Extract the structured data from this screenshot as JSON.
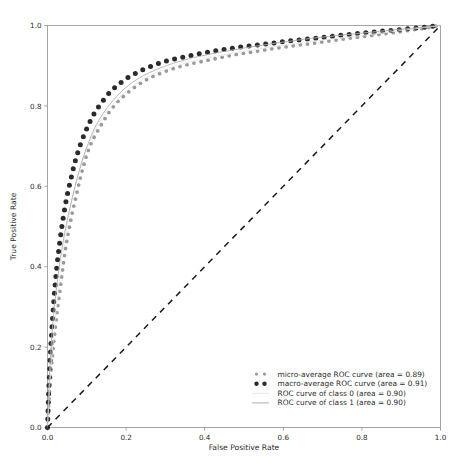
{
  "chart_data": {
    "type": "line",
    "title": "",
    "xlabel": "False Positive Rate",
    "ylabel": "True Positive Rate",
    "xlim": [
      0.0,
      1.0
    ],
    "ylim": [
      0.0,
      1.0
    ],
    "grid": false,
    "legend_position": "lower right",
    "xticks": [
      "0.0",
      "0.2",
      "0.4",
      "0.6",
      "0.8",
      "1.0"
    ],
    "xtick_values": [
      0.0,
      0.2,
      0.4,
      0.6,
      0.8,
      1.0
    ],
    "yticks": [
      "0.0",
      "0.2",
      "0.4",
      "0.6",
      "0.8",
      "1.0"
    ],
    "ytick_values": [
      0.0,
      0.2,
      0.4,
      0.6,
      0.8,
      1.0
    ],
    "series": [
      {
        "name": "micro-average ROC curve (area = 0.89)",
        "style": "dotted",
        "color": "#9a9a9a",
        "marker": "dot",
        "area": 0.89,
        "x": [
          0.0,
          0.004,
          0.008,
          0.012,
          0.016,
          0.02,
          0.024,
          0.028,
          0.032,
          0.036,
          0.04,
          0.045,
          0.05,
          0.056,
          0.062,
          0.068,
          0.075,
          0.082,
          0.09,
          0.1,
          0.11,
          0.12,
          0.135,
          0.15,
          0.165,
          0.18,
          0.2,
          0.22,
          0.245,
          0.27,
          0.3,
          0.33,
          0.36,
          0.4,
          0.44,
          0.48,
          0.52,
          0.57,
          0.62,
          0.67,
          0.72,
          0.78,
          0.84,
          0.9,
          0.95,
          1.0
        ],
        "y": [
          0.0,
          0.075,
          0.13,
          0.175,
          0.215,
          0.25,
          0.285,
          0.315,
          0.345,
          0.375,
          0.405,
          0.44,
          0.47,
          0.5,
          0.53,
          0.555,
          0.585,
          0.615,
          0.645,
          0.68,
          0.705,
          0.725,
          0.75,
          0.775,
          0.795,
          0.812,
          0.83,
          0.845,
          0.862,
          0.874,
          0.886,
          0.896,
          0.904,
          0.912,
          0.92,
          0.928,
          0.934,
          0.942,
          0.949,
          0.955,
          0.962,
          0.97,
          0.977,
          0.985,
          0.992,
          1.0
        ]
      },
      {
        "name": "macro-average ROC curve (area = 0.91)",
        "style": "dotted",
        "color": "#2b2b2b",
        "marker": "dot",
        "area": 0.91,
        "x": [
          0.0,
          0.003,
          0.006,
          0.009,
          0.012,
          0.015,
          0.018,
          0.022,
          0.026,
          0.03,
          0.034,
          0.038,
          0.043,
          0.048,
          0.054,
          0.06,
          0.067,
          0.075,
          0.084,
          0.094,
          0.105,
          0.117,
          0.13,
          0.145,
          0.162,
          0.18,
          0.2,
          0.222,
          0.246,
          0.272,
          0.3,
          0.33,
          0.362,
          0.4,
          0.44,
          0.48,
          0.52,
          0.57,
          0.62,
          0.67,
          0.72,
          0.78,
          0.84,
          0.9,
          0.95,
          1.0
        ],
        "y": [
          0.0,
          0.09,
          0.155,
          0.21,
          0.26,
          0.3,
          0.34,
          0.382,
          0.42,
          0.452,
          0.482,
          0.51,
          0.54,
          0.568,
          0.596,
          0.62,
          0.65,
          0.678,
          0.705,
          0.73,
          0.755,
          0.778,
          0.798,
          0.818,
          0.838,
          0.853,
          0.868,
          0.88,
          0.892,
          0.902,
          0.911,
          0.918,
          0.925,
          0.932,
          0.939,
          0.945,
          0.95,
          0.956,
          0.962,
          0.967,
          0.973,
          0.979,
          0.985,
          0.99,
          0.995,
          1.0
        ]
      },
      {
        "name": "ROC curve of class 0 (area = 0.90)",
        "style": "solid",
        "color": "#e8e8e8",
        "marker": "none",
        "area": 0.9,
        "x": [
          0.0,
          0.005,
          0.01,
          0.016,
          0.022,
          0.028,
          0.035,
          0.042,
          0.05,
          0.058,
          0.067,
          0.077,
          0.088,
          0.1,
          0.114,
          0.13,
          0.148,
          0.168,
          0.19,
          0.215,
          0.245,
          0.28,
          0.32,
          0.37,
          0.43,
          0.5,
          0.58,
          0.67,
          0.78,
          0.89,
          1.0
        ],
        "y": [
          0.0,
          0.095,
          0.165,
          0.235,
          0.295,
          0.35,
          0.405,
          0.455,
          0.5,
          0.545,
          0.585,
          0.625,
          0.66,
          0.695,
          0.725,
          0.755,
          0.782,
          0.806,
          0.828,
          0.848,
          0.868,
          0.884,
          0.898,
          0.911,
          0.924,
          0.936,
          0.948,
          0.96,
          0.973,
          0.986,
          1.0
        ]
      },
      {
        "name": "ROC curve of class 1 (area = 0.90)",
        "style": "solid",
        "color": "#b0b0b0",
        "marker": "none",
        "area": 0.9,
        "x": [
          0.0,
          0.002,
          0.004,
          0.006,
          0.009,
          0.012,
          0.015,
          0.018,
          0.022,
          0.026,
          0.03,
          0.034,
          0.039,
          0.044,
          0.05,
          0.056,
          0.063,
          0.07,
          0.078,
          0.087,
          0.097,
          0.108,
          0.12,
          0.134,
          0.15,
          0.168,
          0.19,
          0.215,
          0.245,
          0.28,
          0.32,
          0.37,
          0.43,
          0.5,
          0.58,
          0.67,
          0.78,
          0.89,
          1.0
        ],
        "y": [
          0.0,
          0.06,
          0.11,
          0.155,
          0.2,
          0.24,
          0.275,
          0.305,
          0.34,
          0.372,
          0.4,
          0.428,
          0.458,
          0.486,
          0.515,
          0.542,
          0.572,
          0.6,
          0.63,
          0.66,
          0.69,
          0.718,
          0.745,
          0.77,
          0.793,
          0.815,
          0.838,
          0.858,
          0.876,
          0.892,
          0.906,
          0.92,
          0.932,
          0.944,
          0.956,
          0.968,
          0.979,
          0.99,
          1.0
        ]
      },
      {
        "name": "chance-diagonal",
        "style": "dashed",
        "color": "#1a1a1a",
        "marker": "none",
        "x": [
          0.0,
          1.0
        ],
        "y": [
          0.0,
          1.0
        ]
      }
    ],
    "legend": [
      {
        "label": "micro-average ROC curve (area = 0.89)",
        "marker": "dot",
        "color": "#9a9a9a"
      },
      {
        "label": "macro-average ROC curve (area = 0.91)",
        "marker": "dot",
        "color": "#2b2b2b"
      },
      {
        "label": "ROC curve of class 0 (area = 0.90)",
        "marker": "line",
        "color": "#e8e8e8"
      },
      {
        "label": "ROC curve of class 1 (area = 0.90)",
        "marker": "line",
        "color": "#b0b0b0"
      }
    ]
  }
}
